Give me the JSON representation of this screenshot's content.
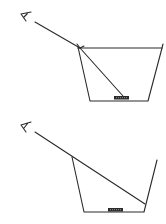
{
  "diagram": {
    "type": "physics-refraction",
    "colors": {
      "ink": "#2a2a2a",
      "background": "#ffffff"
    },
    "panels": [
      {
        "id": "with-water",
        "label": "Cup with water (coin visible via refraction)",
        "eye": {
          "x": 24,
          "y": 17
        },
        "incident_ray": {
          "x1": 35,
          "y1": 22,
          "x2": 80,
          "y2": 48
        },
        "refracted_ray": {
          "x1": 80,
          "y1": 48,
          "x2": 123,
          "y2": 97
        },
        "water_surface": {
          "x1": 78,
          "y1": 48,
          "x2": 162,
          "y2": 48
        },
        "cup": {
          "points": "78,48 90,101 148,101 162,48",
          "rim_extension": {
            "x": 163,
            "y": 45
          }
        },
        "coin": {
          "x": 114,
          "y": 96,
          "w": 15,
          "h": 3.5
        }
      },
      {
        "id": "without-water",
        "label": "Empty cup (coin hidden)",
        "eye": {
          "x": 24,
          "y": 127
        },
        "incident_ray": {
          "x1": 35,
          "y1": 132,
          "x2": 145,
          "y2": 204
        },
        "cup": {
          "points": "72,157 84,212 144,212 157,160"
        },
        "coin": {
          "x": 108,
          "y": 208,
          "w": 15,
          "h": 3.5
        }
      }
    ]
  }
}
